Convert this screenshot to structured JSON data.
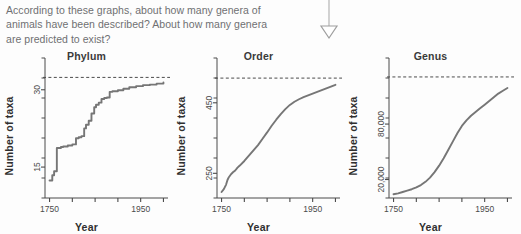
{
  "question": {
    "lines": [
      "According to these graphs, about how many genera of",
      "animals have been described? About how many genera",
      "are predicted to exist?"
    ],
    "text_color": "#6f7072"
  },
  "arrow": {
    "name": "down-arrow",
    "direction": "down",
    "color": "#b0b0b0"
  },
  "style": {
    "curve_color": "#767676",
    "axis_color": "#4b4b4b",
    "dashed_color": "#4b4b4b",
    "background": "#fdfdfd"
  },
  "chart_data": [
    {
      "type": "line",
      "title": "Phylum",
      "xlabel": "Year",
      "ylabel": "Number of taxa",
      "grid": false,
      "legend": null,
      "xlim": [
        1740,
        2010
      ],
      "ylim": [
        9,
        35
      ],
      "xticks": [
        1750,
        1800,
        1850,
        1900,
        1950,
        2000
      ],
      "xticklabels": [
        "1750",
        "",
        "",
        "",
        "1950",
        ""
      ],
      "yticks": [
        15,
        30
      ],
      "yticklabels": [
        "15",
        "30"
      ],
      "annotations": [
        {
          "type": "hline",
          "label": "predicted total",
          "value": 32.4,
          "style": "dashed"
        }
      ],
      "series": [
        {
          "name": "described taxa",
          "step": true,
          "x": [
            1750,
            1753,
            1756,
            1758,
            1760,
            1762,
            1766,
            1770,
            1775,
            1780,
            1790,
            1800,
            1808,
            1814,
            1820,
            1826,
            1830,
            1836,
            1842,
            1848,
            1852,
            1858,
            1864,
            1870,
            1876,
            1882,
            1888,
            1900,
            1912,
            1925,
            1940,
            1955,
            1970,
            1985,
            2000
          ],
          "y": [
            12.4,
            12.4,
            13.4,
            13.4,
            14.2,
            14.2,
            18.7,
            18.7,
            18.9,
            19.0,
            19.2,
            19.4,
            20.6,
            20.8,
            21.0,
            22.5,
            23.2,
            24.0,
            25.4,
            26.6,
            27.1,
            27.5,
            28.2,
            28.4,
            28.5,
            29.6,
            29.7,
            29.9,
            30.2,
            30.5,
            30.7,
            30.9,
            31.0,
            31.2,
            31.4
          ]
        }
      ]
    },
    {
      "type": "line",
      "title": "Order",
      "xlabel": "Year",
      "ylabel": "Number of taxa",
      "grid": false,
      "legend": null,
      "xlim": [
        1740,
        2010
      ],
      "ylim": [
        180,
        560
      ],
      "xticks": [
        1750,
        1800,
        1850,
        1900,
        1950,
        2000
      ],
      "xticklabels": [
        "1750",
        "",
        "",
        "",
        "1950",
        ""
      ],
      "yticks": [
        250,
        450
      ],
      "yticklabels": [
        "250",
        "450"
      ],
      "annotations": [
        {
          "type": "hline",
          "label": "predicted total",
          "value": 520,
          "style": "dashed"
        }
      ],
      "series": [
        {
          "name": "described taxa",
          "step": false,
          "x": [
            1750,
            1755,
            1760,
            1763,
            1766,
            1770,
            1775,
            1780,
            1785,
            1790,
            1800,
            1810,
            1820,
            1830,
            1840,
            1850,
            1860,
            1870,
            1880,
            1890,
            1900,
            1910,
            1920,
            1930,
            1940,
            1950,
            1960,
            1970,
            1980,
            1990,
            2000
          ],
          "y": [
            197,
            205,
            218,
            231,
            239,
            246,
            253,
            258,
            266,
            272,
            285,
            300,
            315,
            330,
            348,
            366,
            385,
            402,
            418,
            432,
            444,
            453,
            460,
            466,
            471,
            476,
            481,
            486,
            491,
            496,
            501
          ]
        }
      ]
    },
    {
      "type": "line",
      "title": "Genus",
      "xlabel": "Year",
      "ylabel": "Number of taxa",
      "grid": false,
      "legend": null,
      "xlim": [
        1740,
        2010
      ],
      "ylim": [
        0,
        145000
      ],
      "xticks": [
        1750,
        1800,
        1850,
        1900,
        1950,
        2000
      ],
      "xticklabels": [
        "1750",
        "",
        "",
        "",
        "1950",
        ""
      ],
      "yticks": [
        20000,
        80000
      ],
      "yticklabels": [
        "20,000",
        "80,000"
      ],
      "annotations": [
        {
          "type": "hline",
          "label": "predicted total",
          "value": 131000,
          "style": "dashed"
        }
      ],
      "series": [
        {
          "name": "described taxa",
          "step": false,
          "x": [
            1750,
            1760,
            1770,
            1780,
            1790,
            1800,
            1810,
            1820,
            1830,
            1840,
            1850,
            1860,
            1870,
            1880,
            1890,
            1900,
            1910,
            1920,
            1930,
            1940,
            1950,
            1960,
            1970,
            1980,
            1990,
            2000
          ],
          "y": [
            4000,
            5000,
            6500,
            8000,
            9500,
            11500,
            14000,
            17500,
            22000,
            28000,
            35000,
            43000,
            52000,
            61000,
            70000,
            78000,
            84000,
            89000,
            93000,
            97000,
            101000,
            105000,
            109000,
            113000,
            116000,
            119000
          ]
        }
      ]
    }
  ]
}
